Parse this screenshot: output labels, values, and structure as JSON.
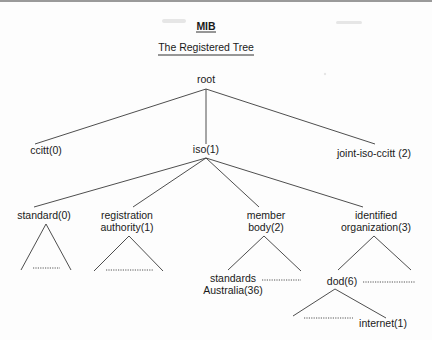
{
  "header": {
    "title": "MIB",
    "subtitle": "The Registered Tree"
  },
  "colors": {
    "text": "#1a1a1a",
    "line": "#3a3a3a",
    "border": "#9a9a9a"
  },
  "tree": {
    "nodes": [
      {
        "id": "root",
        "lines": [
          "root"
        ],
        "x": 206,
        "y": 83
      },
      {
        "id": "ccitt",
        "lines": [
          "ccitt(0)"
        ],
        "x": 46,
        "y": 154
      },
      {
        "id": "iso",
        "lines": [
          "iso(1)"
        ],
        "x": 206,
        "y": 153
      },
      {
        "id": "joint",
        "lines": [
          "joint-iso-ccitt (2)"
        ],
        "x": 374,
        "y": 157
      },
      {
        "id": "standard",
        "lines": [
          "standard(0)"
        ],
        "x": 44,
        "y": 219
      },
      {
        "id": "registration",
        "lines": [
          "registration",
          "authority(1)"
        ],
        "x": 127,
        "y": 219
      },
      {
        "id": "member",
        "lines": [
          "member",
          "body(2)"
        ],
        "x": 266,
        "y": 219
      },
      {
        "id": "identified",
        "lines": [
          "identified",
          "organization(3)"
        ],
        "x": 376,
        "y": 219
      },
      {
        "id": "standards-australia",
        "lines": [
          "standards",
          "Australia(36)"
        ],
        "x": 233,
        "y": 282
      },
      {
        "id": "dod",
        "lines": [
          "dod(6)"
        ],
        "x": 342,
        "y": 285
      },
      {
        "id": "internet",
        "lines": [
          "internet(1)"
        ],
        "x": 383,
        "y": 327
      }
    ],
    "edges": [
      {
        "from": [
          206,
          89
        ],
        "to": [
          35,
          144
        ]
      },
      {
        "from": [
          206,
          89
        ],
        "to": [
          206,
          144
        ]
      },
      {
        "from": [
          206,
          89
        ],
        "to": [
          375,
          144
        ]
      },
      {
        "from": [
          206,
          158
        ],
        "to": [
          34,
          207
        ]
      },
      {
        "from": [
          206,
          158
        ],
        "to": [
          133,
          207
        ]
      },
      {
        "from": [
          206,
          158
        ],
        "to": [
          259,
          207
        ]
      },
      {
        "from": [
          206,
          158
        ],
        "to": [
          363,
          207
        ]
      },
      {
        "from": [
          46,
          224
        ],
        "to": [
          21,
          270
        ]
      },
      {
        "from": [
          46,
          224
        ],
        "to": [
          71,
          270
        ]
      },
      {
        "from": [
          129,
          236
        ],
        "to": [
          94,
          271
        ]
      },
      {
        "from": [
          129,
          236
        ],
        "to": [
          163,
          271
        ]
      },
      {
        "from": [
          264,
          236
        ],
        "to": [
          228,
          270
        ]
      },
      {
        "from": [
          264,
          236
        ],
        "to": [
          301,
          271
        ]
      },
      {
        "from": [
          374,
          236
        ],
        "to": [
          338,
          270
        ]
      },
      {
        "from": [
          374,
          236
        ],
        "to": [
          411,
          270
        ]
      },
      {
        "from": [
          335,
          289
        ],
        "to": [
          293,
          316
        ]
      },
      {
        "from": [
          335,
          289
        ],
        "to": [
          386,
          318
        ]
      }
    ],
    "ellipses": [
      {
        "x1": 33,
        "x2": 60,
        "y": 268
      },
      {
        "x1": 106,
        "x2": 154,
        "y": 270
      },
      {
        "x1": 262,
        "x2": 301,
        "y": 280
      },
      {
        "x1": 363,
        "x2": 415,
        "y": 282
      },
      {
        "x1": 304,
        "x2": 353,
        "y": 318
      }
    ]
  }
}
